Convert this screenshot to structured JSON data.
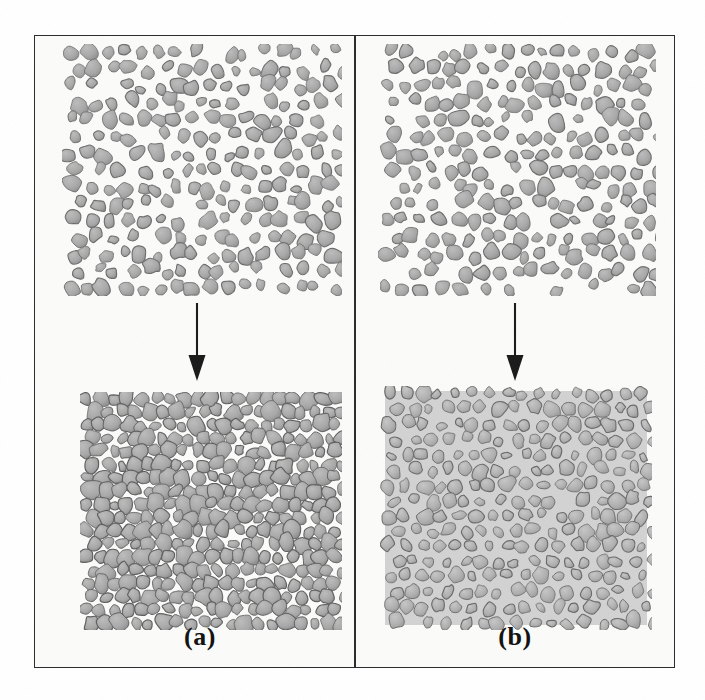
{
  "figure": {
    "kind": "scientific-illustration",
    "background_color": "#ffffff",
    "frame_color": "#2b2b2b",
    "inner_background_color": "#fbfbfa"
  },
  "panels": [
    {
      "id": "a",
      "caption": "(a)",
      "arrow": {
        "name": "down-arrow",
        "direction": "down",
        "color": "#1a1a1a"
      },
      "stages": [
        {
          "id": "a-before",
          "role": "before",
          "description": "Loosely packed irregular grains with open pores between them",
          "matrix_fill": "none",
          "grain_fill": "#a8a8a8",
          "grain_stroke": "#6d6d6d",
          "grain_count": 196,
          "packing_density": 0.56
        },
        {
          "id": "a-after",
          "role": "after",
          "description": "Densified compact: grains in direct contact, pores nearly eliminated",
          "matrix_fill": "none",
          "grain_fill": "#a6a6a6",
          "grain_stroke": "#5f5f5f",
          "grain_count": 310,
          "packing_density": 0.92
        }
      ]
    },
    {
      "id": "b",
      "caption": "(b)",
      "arrow": {
        "name": "down-arrow",
        "direction": "down",
        "color": "#1a1a1a"
      },
      "stages": [
        {
          "id": "b-before",
          "role": "before",
          "description": "Loosely packed irregular grains with open pores between them",
          "matrix_fill": "none",
          "grain_fill": "#a8a8a8",
          "grain_stroke": "#6d6d6d",
          "grain_count": 190,
          "packing_density": 0.55
        },
        {
          "id": "b-after",
          "role": "after",
          "description": "Grains rearranged and surrounded by a continuous light grey second phase filling the pores",
          "matrix_fill": "#d2d2d2",
          "grain_fill": "#b0b0b0",
          "grain_stroke": "#6a6a6a",
          "grain_count": 205,
          "packing_density": 0.62
        }
      ]
    }
  ],
  "colors": {
    "grain_fill": "#a8a8a8",
    "grain_fill_light": "#bcbcbc",
    "grain_stroke": "#6d6d6d",
    "matrix_fill": "#d2d2d2",
    "frame": "#2b2b2b",
    "caption_text": "#111111",
    "arrow": "#1a1a1a",
    "page_background": "#ffffff",
    "panel_background": "#fbfbfa"
  }
}
